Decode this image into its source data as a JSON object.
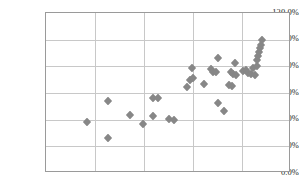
{
  "chart_data": {
    "type": "scatter",
    "title": "",
    "xlabel": "",
    "ylabel": "",
    "ylim": [
      0,
      120
    ],
    "ytick_labels": [
      "0.0%",
      "20.0%",
      "40.0%",
      "60.0%",
      "80.0%",
      "100.0%",
      "120.0%"
    ],
    "ytick_values": [
      0,
      20,
      40,
      60,
      80,
      100,
      120
    ],
    "xlim": [
      0,
      5
    ],
    "xtick_labels": [],
    "xtick_values": [
      0,
      1,
      2,
      3,
      4,
      5
    ],
    "grid": true,
    "legend": false,
    "marker_shape": "diamond",
    "marker_color": "#878787",
    "axis_color": "#9a9a9a",
    "gridline_color": "#c8c8c8",
    "background_color": "#ffffff",
    "series": [
      {
        "name": "Series 1",
        "points": [
          {
            "x": 0.84,
            "y": 38.5
          },
          {
            "x": 1.27,
            "y": 26.5
          },
          {
            "x": 1.27,
            "y": 54.0
          },
          {
            "x": 1.72,
            "y": 43.5
          },
          {
            "x": 1.98,
            "y": 37.0
          },
          {
            "x": 2.19,
            "y": 42.5
          },
          {
            "x": 2.18,
            "y": 56.0
          },
          {
            "x": 2.29,
            "y": 56.5
          },
          {
            "x": 2.52,
            "y": 40.5
          },
          {
            "x": 2.61,
            "y": 40.0
          },
          {
            "x": 2.87,
            "y": 64.5
          },
          {
            "x": 2.93,
            "y": 69.5
          },
          {
            "x": 3.0,
            "y": 71.5
          },
          {
            "x": 2.98,
            "y": 78.5
          },
          {
            "x": 3.22,
            "y": 67.0
          },
          {
            "x": 3.36,
            "y": 78.0
          },
          {
            "x": 3.41,
            "y": 76.0
          },
          {
            "x": 3.46,
            "y": 75.5
          },
          {
            "x": 3.5,
            "y": 86.5
          },
          {
            "x": 3.5,
            "y": 52.5
          },
          {
            "x": 3.63,
            "y": 46.5
          },
          {
            "x": 3.74,
            "y": 66.0
          },
          {
            "x": 3.8,
            "y": 65.5
          },
          {
            "x": 3.78,
            "y": 76.0
          },
          {
            "x": 3.82,
            "y": 74.5
          },
          {
            "x": 3.88,
            "y": 73.5
          },
          {
            "x": 3.85,
            "y": 82.5
          },
          {
            "x": 4.02,
            "y": 76.5
          },
          {
            "x": 4.09,
            "y": 77.0
          },
          {
            "x": 4.13,
            "y": 75.0
          },
          {
            "x": 4.18,
            "y": 74.0
          },
          {
            "x": 4.22,
            "y": 78.5
          },
          {
            "x": 4.26,
            "y": 73.5
          },
          {
            "x": 4.3,
            "y": 84.5
          },
          {
            "x": 4.33,
            "y": 87.5
          },
          {
            "x": 4.34,
            "y": 91.0
          },
          {
            "x": 4.36,
            "y": 93.5
          },
          {
            "x": 4.38,
            "y": 96.0
          },
          {
            "x": 4.4,
            "y": 99.5
          },
          {
            "x": 4.31,
            "y": 80.0
          }
        ]
      }
    ]
  }
}
